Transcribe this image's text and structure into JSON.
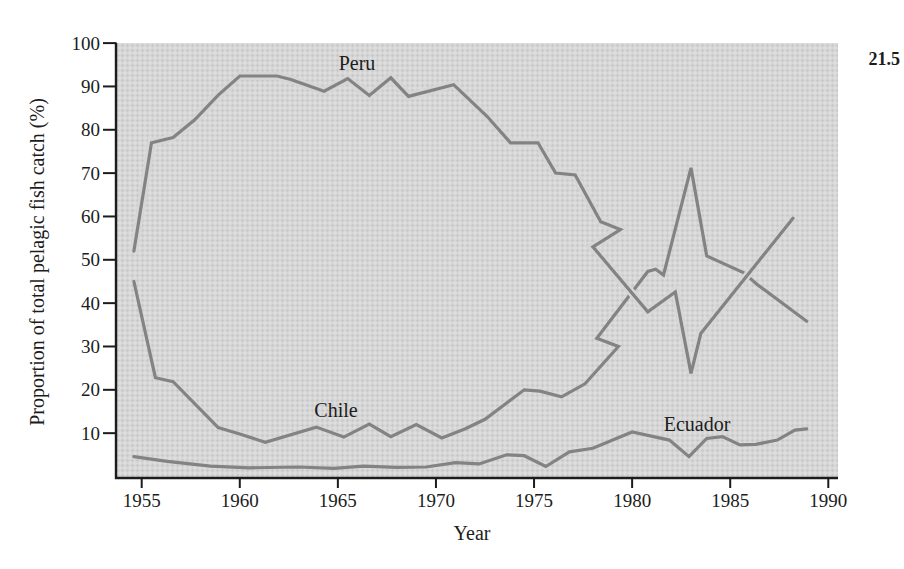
{
  "figure_number": "21.5",
  "series_labels": {
    "peru": "Peru",
    "chile": "Chile",
    "ecuador": "Ecuador"
  },
  "axes": {
    "x": {
      "title": "Year",
      "ticks": [
        1955,
        1960,
        1965,
        1970,
        1975,
        1980,
        1985,
        1990
      ]
    },
    "y": {
      "title": "Proportion of total pelagic fish catch (%)",
      "ticks": [
        10,
        20,
        30,
        40,
        50,
        60,
        70,
        80,
        90,
        100
      ],
      "range_percent": [
        0,
        100
      ]
    }
  },
  "colors": {
    "page_background": "#ffffff",
    "plot_background": "#d6d6d6",
    "line_gray": "#838383",
    "axis_black": "#1c1c1c",
    "text": "#1c1c1c"
  },
  "chart_data": {
    "type": "line",
    "x_unit": "year",
    "y_unit": "percent of total pelagic fish catch",
    "xlim": [
      1953.6,
      1990.5
    ],
    "ylim": [
      0,
      100
    ],
    "grid": false,
    "legend": "in-plot text labels",
    "note": "Vertices digitized from the printed figure. The Peru and Chile polylines each include a small backward zigzag near 1977-1979 exactly as drawn in the original; the 1983 El Nino shows as Chile spiking to 71% while Peru collapses to 24%.",
    "series": [
      {
        "name": "Ecuador",
        "points": [
          [
            1954.6,
            4.6
          ],
          [
            1956.3,
            3.5
          ],
          [
            1958.5,
            2.4
          ],
          [
            1960.5,
            2.0
          ],
          [
            1963.0,
            2.2
          ],
          [
            1964.8,
            1.9
          ],
          [
            1966.3,
            2.4
          ],
          [
            1968.0,
            2.1
          ],
          [
            1969.5,
            2.2
          ],
          [
            1971.0,
            3.2
          ],
          [
            1972.2,
            2.9
          ],
          [
            1973.6,
            5.0
          ],
          [
            1974.5,
            4.8
          ],
          [
            1975.6,
            2.3
          ],
          [
            1976.8,
            5.7
          ],
          [
            1978.0,
            6.5
          ],
          [
            1980.0,
            10.3
          ],
          [
            1981.9,
            8.4
          ],
          [
            1982.9,
            4.6
          ],
          [
            1983.8,
            8.8
          ],
          [
            1984.6,
            9.2
          ],
          [
            1985.5,
            7.3
          ],
          [
            1986.3,
            7.4
          ],
          [
            1987.4,
            8.4
          ],
          [
            1988.3,
            10.7
          ],
          [
            1988.9,
            11.0
          ]
        ]
      },
      {
        "name": "Chile",
        "points": [
          [
            1954.6,
            45.0
          ],
          [
            1955.7,
            22.8
          ],
          [
            1956.6,
            21.9
          ],
          [
            1958.9,
            11.3
          ],
          [
            1960.0,
            9.8
          ],
          [
            1961.3,
            7.9
          ],
          [
            1963.9,
            11.4
          ],
          [
            1965.3,
            9.1
          ],
          [
            1966.6,
            12.1
          ],
          [
            1967.7,
            9.2
          ],
          [
            1969.0,
            12.0
          ],
          [
            1970.3,
            8.9
          ],
          [
            1971.5,
            11.0
          ],
          [
            1972.5,
            13.2
          ],
          [
            1974.5,
            20.0
          ],
          [
            1975.3,
            19.7
          ],
          [
            1976.4,
            18.4
          ],
          [
            1977.6,
            21.4
          ],
          [
            1979.3,
            30.0
          ],
          [
            1978.2,
            31.9
          ],
          [
            1980.8,
            47.3
          ],
          [
            1981.2,
            47.8
          ],
          [
            1981.6,
            46.5
          ],
          [
            1983.0,
            71.2
          ],
          [
            1983.8,
            50.9
          ],
          [
            1985.7,
            47.0
          ],
          [
            1986.4,
            44.2
          ],
          [
            1988.9,
            35.8
          ]
        ]
      },
      {
        "name": "Peru",
        "points": [
          [
            1954.6,
            52.0
          ],
          [
            1955.5,
            77.0
          ],
          [
            1956.6,
            78.2
          ],
          [
            1957.7,
            82.3
          ],
          [
            1958.9,
            88.0
          ],
          [
            1960.0,
            92.4
          ],
          [
            1961.9,
            92.4
          ],
          [
            1962.6,
            91.6
          ],
          [
            1964.3,
            88.9
          ],
          [
            1965.5,
            91.8
          ],
          [
            1966.6,
            87.9
          ],
          [
            1967.7,
            92.0
          ],
          [
            1968.6,
            87.7
          ],
          [
            1970.9,
            90.4
          ],
          [
            1972.6,
            83.1
          ],
          [
            1973.8,
            77.0
          ],
          [
            1975.2,
            77.0
          ],
          [
            1976.1,
            70.0
          ],
          [
            1977.1,
            69.6
          ],
          [
            1978.4,
            58.8
          ],
          [
            1979.4,
            57.0
          ],
          [
            1978.0,
            53.0
          ],
          [
            1980.8,
            38.0
          ],
          [
            1982.2,
            42.6
          ],
          [
            1983.0,
            23.8
          ],
          [
            1983.5,
            33.0
          ],
          [
            1988.2,
            59.6
          ]
        ]
      }
    ]
  }
}
